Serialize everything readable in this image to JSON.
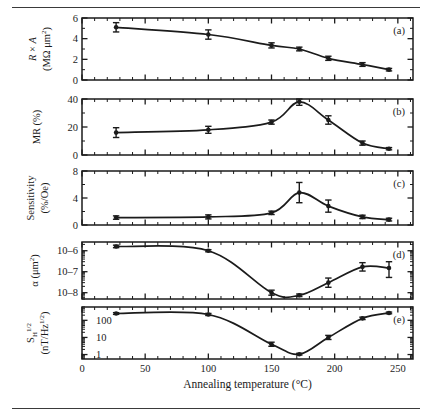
{
  "figure": {
    "x_axis": {
      "title": "Annealing temperature (°C)",
      "ticks": [
        0,
        50,
        100,
        150,
        200,
        250
      ],
      "tick_labels": [
        "0",
        "50",
        "100",
        "150",
        "200",
        "250"
      ],
      "range": [
        0,
        262
      ],
      "minor_tick_step": 10
    },
    "panels": [
      {
        "id": "a",
        "label": "(a)",
        "ylabel_line1": "R × A",
        "ylabel_line2": "(MΩ μm²)",
        "scale": "linear",
        "ylim": [
          0,
          6
        ],
        "yticks": [
          0,
          2,
          4,
          6
        ],
        "ytick_labels": [
          "0",
          "2",
          "4",
          "6"
        ],
        "x": [
          27,
          100,
          150,
          172,
          195,
          222,
          243
        ],
        "y": [
          5.1,
          4.4,
          3.35,
          3.0,
          2.1,
          1.5,
          1.0
        ],
        "yerr": [
          0.45,
          0.45,
          0.25,
          0.18,
          0.2,
          0.18,
          0.12
        ]
      },
      {
        "id": "b",
        "label": "(b)",
        "ylabel_line1": "MR (%)",
        "ylabel_line2": "",
        "scale": "linear",
        "ylim": [
          0,
          40
        ],
        "yticks": [
          0,
          20,
          40
        ],
        "ytick_labels": [
          "0",
          "20",
          "40"
        ],
        "x": [
          27,
          100,
          150,
          172,
          195,
          222,
          243
        ],
        "y": [
          16,
          18,
          23.5,
          38,
          25,
          8.5,
          4.5
        ],
        "yerr": [
          3.5,
          2.5,
          1.5,
          2.5,
          3.0,
          1.5,
          0.8
        ]
      },
      {
        "id": "c",
        "label": "(c)",
        "ylabel_line1": "Sensitivity",
        "ylabel_line2": "(%/Oe)",
        "scale": "linear",
        "ylim": [
          0,
          8
        ],
        "yticks": [
          0,
          4,
          8
        ],
        "ytick_labels": [
          "0",
          "4",
          "8"
        ],
        "x": [
          27,
          100,
          150,
          172,
          195,
          222,
          243
        ],
        "y": [
          1.1,
          1.2,
          1.8,
          4.8,
          2.8,
          1.2,
          0.8
        ],
        "yerr": [
          0.25,
          0.3,
          0.25,
          1.5,
          0.9,
          0.25,
          0.2
        ]
      },
      {
        "id": "d",
        "label": "(d)",
        "ylabel_line1": "α (μm²)",
        "ylabel_line2": "",
        "scale": "log",
        "ylim": [
          5e-09,
          2.6e-06
        ],
        "yticks": [
          1e-08,
          1e-07,
          1e-06
        ],
        "ytick_labels": [
          "10–8",
          "10–7",
          "10–6"
        ],
        "x": [
          27,
          100,
          150,
          172,
          195,
          222,
          243
        ],
        "y": [
          1.6e-06,
          1e-06,
          1e-08,
          7.5e-09,
          3e-08,
          1.7e-07,
          1.5e-07
        ],
        "yerr_log_up": [
          0.06,
          0.05,
          0.12,
          0.06,
          0.22,
          0.2,
          0.3
        ],
        "yerr_log_dn": [
          0.06,
          0.05,
          0.12,
          0.06,
          0.22,
          0.2,
          0.45
        ]
      },
      {
        "id": "e",
        "label": "(e)",
        "ylabel_line1": "S",
        "ylabel_sub": "H",
        "ylabel_sup": "1/2",
        "ylabel_line2": "(nT/Hz",
        "ylabel_line2_sup": "1/2",
        "ylabel_line2_end": ")",
        "scale": "log",
        "ylim": [
          0.55,
          600
        ],
        "yticks": [
          1,
          10,
          100
        ],
        "ytick_labels": [
          "1",
          "10",
          "100"
        ],
        "x": [
          27,
          100,
          150,
          172,
          195,
          222,
          243
        ],
        "y": [
          250,
          220,
          4.0,
          1.05,
          10.0,
          130,
          270
        ],
        "yerr_log_up": [
          0.05,
          0.06,
          0.12,
          0.05,
          0.12,
          0.07,
          0.05
        ],
        "yerr_log_dn": [
          0.05,
          0.06,
          0.12,
          0.05,
          0.12,
          0.07,
          0.05
        ]
      }
    ]
  },
  "chart_data": {
    "type": "line",
    "title": "",
    "xlabel": "Annealing temperature (°C)",
    "xlim": [
      0,
      262
    ],
    "xticks": [
      0,
      50,
      100,
      150,
      200,
      250
    ],
    "grid": false,
    "legend": "none",
    "subplots": [
      {
        "panel": "a",
        "ylabel": "R × A (MΩ μm²)",
        "yscale": "linear",
        "ylim": [
          0,
          6
        ],
        "yticks": [
          0,
          2,
          4,
          6
        ],
        "x": [
          27,
          100,
          150,
          172,
          195,
          222,
          243
        ],
        "values": [
          5.1,
          4.4,
          3.35,
          3.0,
          2.1,
          1.5,
          1.0
        ],
        "yerr": [
          0.45,
          0.45,
          0.25,
          0.18,
          0.2,
          0.18,
          0.12
        ]
      },
      {
        "panel": "b",
        "ylabel": "MR (%)",
        "yscale": "linear",
        "ylim": [
          0,
          40
        ],
        "yticks": [
          0,
          20,
          40
        ],
        "x": [
          27,
          100,
          150,
          172,
          195,
          222,
          243
        ],
        "values": [
          16,
          18,
          23.5,
          38,
          25,
          8.5,
          4.5
        ],
        "yerr": [
          3.5,
          2.5,
          1.5,
          2.5,
          3.0,
          1.5,
          0.8
        ]
      },
      {
        "panel": "c",
        "ylabel": "Sensitivity (%/Oe)",
        "yscale": "linear",
        "ylim": [
          0,
          8
        ],
        "yticks": [
          0,
          4,
          8
        ],
        "x": [
          27,
          100,
          150,
          172,
          195,
          222,
          243
        ],
        "values": [
          1.1,
          1.2,
          1.8,
          4.8,
          2.8,
          1.2,
          0.8
        ],
        "yerr": [
          0.25,
          0.3,
          0.25,
          1.5,
          0.9,
          0.25,
          0.2
        ]
      },
      {
        "panel": "d",
        "ylabel": "α (μm²)",
        "yscale": "log",
        "ylim": [
          5e-09,
          2.6e-06
        ],
        "yticks": [
          1e-08,
          1e-07,
          1e-06
        ],
        "x": [
          27,
          100,
          150,
          172,
          195,
          222,
          243
        ],
        "values": [
          1.6e-06,
          1e-06,
          1e-08,
          7.5e-09,
          3e-08,
          1.7e-07,
          1.5e-07
        ]
      },
      {
        "panel": "e",
        "ylabel": "S_H^(1/2) (nT/Hz^(1/2))",
        "yscale": "log",
        "ylim": [
          0.55,
          600
        ],
        "yticks": [
          1,
          10,
          100
        ],
        "x": [
          27,
          100,
          150,
          172,
          195,
          222,
          243
        ],
        "values": [
          250,
          220,
          4.0,
          1.05,
          10.0,
          130,
          270
        ]
      }
    ]
  }
}
